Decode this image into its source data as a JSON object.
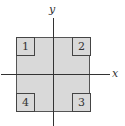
{
  "axes": {
    "x_label": "x",
    "y_label": "y"
  },
  "regions": [
    {
      "label": "1",
      "position": "top-left"
    },
    {
      "label": "2",
      "position": "top-right"
    },
    {
      "label": "3",
      "position": "bottom-right"
    },
    {
      "label": "4",
      "position": "bottom-left"
    }
  ],
  "colors": {
    "fill": "#d9d9d9",
    "stroke": "#444444"
  }
}
